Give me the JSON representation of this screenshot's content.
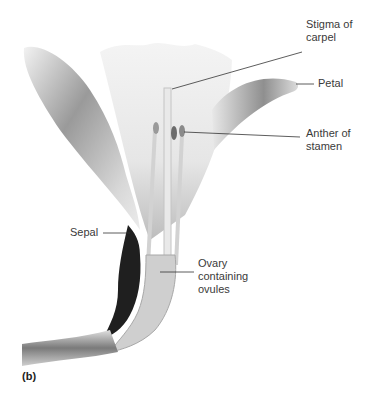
{
  "figure": {
    "panel_label": "(b)",
    "labels": {
      "stigma": [
        "Stigma of",
        "carpel"
      ],
      "petal": [
        "Petal"
      ],
      "anther": [
        "Anther of",
        "stamen"
      ],
      "sepal": [
        "Sepal"
      ],
      "ovary": [
        "Ovary",
        "containing",
        "ovules"
      ]
    }
  }
}
